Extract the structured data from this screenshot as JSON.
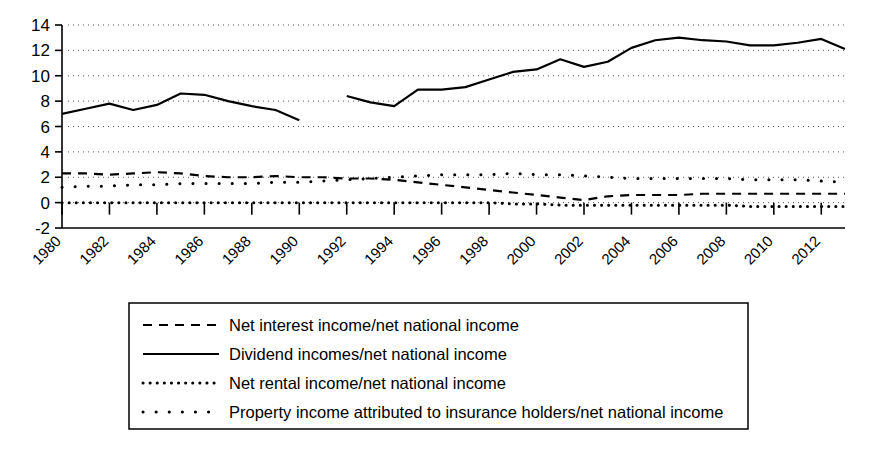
{
  "chart_data": {
    "type": "line",
    "title": "",
    "subtitle": "",
    "xlabel": "",
    "ylabel": "",
    "xlim": [
      1980,
      2013
    ],
    "ylim": [
      -2,
      14
    ],
    "ytick_values": [
      -2,
      0,
      2,
      4,
      6,
      8,
      10,
      12,
      14
    ],
    "ytick_labels": [
      "-2",
      "0",
      "2",
      "4",
      "6",
      "8",
      "10",
      "12",
      "14"
    ],
    "xtick_values": [
      1980,
      1982,
      1984,
      1986,
      1988,
      1990,
      1992,
      1994,
      1996,
      1998,
      2000,
      2002,
      2004,
      2006,
      2008,
      2010,
      2012
    ],
    "xtick_labels": [
      "1980",
      "1982",
      "1984",
      "1986",
      "1988",
      "1990",
      "1992",
      "1994",
      "1996",
      "1998",
      "2000",
      "2002",
      "2004",
      "2006",
      "2008",
      "2010",
      "2012"
    ],
    "grid": "horizontal-dotted",
    "legend_position": "below-center",
    "x": [
      1980,
      1981,
      1982,
      1983,
      1984,
      1985,
      1986,
      1987,
      1988,
      1989,
      1990,
      1991,
      1992,
      1993,
      1994,
      1995,
      1996,
      1997,
      1998,
      1999,
      2000,
      2001,
      2002,
      2003,
      2004,
      2005,
      2006,
      2007,
      2008,
      2009,
      2010,
      2011,
      2012,
      2013
    ],
    "series": [
      {
        "name": "Net interest income/net national income",
        "style": "dashed",
        "values": [
          2.3,
          2.3,
          2.2,
          2.3,
          2.4,
          2.3,
          2.1,
          2.0,
          2.0,
          2.1,
          2.0,
          2.0,
          1.9,
          1.9,
          1.8,
          1.6,
          1.4,
          1.2,
          1.0,
          0.8,
          0.6,
          0.4,
          0.2,
          0.5,
          0.6,
          0.6,
          0.6,
          0.7,
          0.7,
          0.7,
          0.7,
          0.7,
          0.7,
          0.7
        ]
      },
      {
        "name": "Dividend incomes/net national income",
        "style": "solid",
        "values": [
          7.0,
          7.4,
          7.8,
          7.3,
          7.7,
          8.6,
          8.5,
          8.0,
          7.6,
          7.3,
          6.5,
          null,
          8.4,
          7.9,
          7.6,
          8.9,
          8.9,
          9.1,
          9.7,
          10.3,
          10.5,
          11.3,
          10.7,
          11.1,
          12.2,
          12.8,
          13.0,
          12.8,
          12.7,
          12.4,
          12.4,
          12.6,
          12.9,
          12.1
        ],
        "note": "series break between 1990 and 1991"
      },
      {
        "name": "Net rental income/net national income",
        "style": "dotted-dense",
        "values": [
          0.0,
          0.0,
          0.0,
          0.0,
          0.0,
          0.0,
          0.0,
          0.0,
          0.0,
          0.0,
          0.0,
          0.0,
          0.0,
          0.0,
          0.0,
          0.0,
          0.0,
          0.0,
          0.0,
          -0.1,
          -0.1,
          -0.2,
          -0.2,
          -0.2,
          -0.2,
          -0.2,
          -0.2,
          -0.2,
          -0.2,
          -0.3,
          -0.3,
          -0.3,
          -0.3,
          -0.3
        ]
      },
      {
        "name": "Property income attributed to insurance holders/net national income",
        "style": "dotted-sparse",
        "values": [
          1.2,
          1.3,
          1.3,
          1.4,
          1.4,
          1.5,
          1.5,
          1.5,
          1.5,
          1.6,
          1.6,
          1.7,
          1.8,
          1.9,
          2.0,
          2.1,
          2.2,
          2.2,
          2.2,
          2.3,
          2.2,
          2.2,
          2.1,
          2.0,
          1.9,
          1.9,
          1.9,
          1.9,
          1.9,
          1.8,
          1.8,
          1.8,
          1.7,
          1.6
        ]
      }
    ]
  },
  "legend": {
    "entries": [
      {
        "label": "Net interest income/net national income",
        "style": "dashed"
      },
      {
        "label": "Dividend incomes/net national income",
        "style": "solid"
      },
      {
        "label": "Net rental income/net national income",
        "style": "dotted-dense"
      },
      {
        "label": "Property income attributed to insurance holders/net national income",
        "style": "dotted-sparse"
      }
    ]
  },
  "colors": {
    "ink": "#000000",
    "background": "#ffffff",
    "grid": "#555555"
  }
}
